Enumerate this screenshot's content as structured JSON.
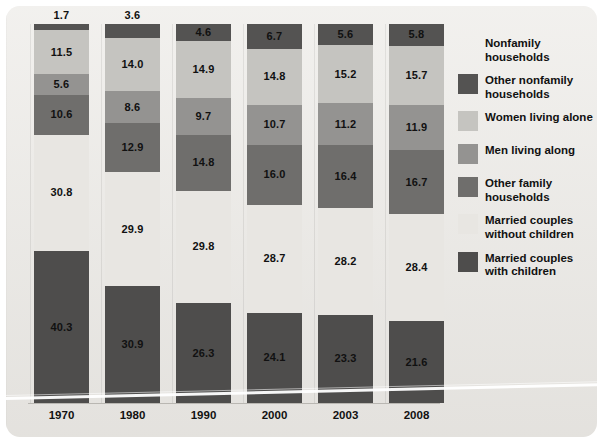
{
  "chart_data": {
    "type": "bar",
    "title": "",
    "subtitle": "",
    "xlabel": "",
    "ylabel": "",
    "stacked": true,
    "stack_mode": "percent",
    "ylim": [
      0,
      100
    ],
    "grid": false,
    "legend_position": "right",
    "categories": [
      "1970",
      "1980",
      "1990",
      "2000",
      "2003",
      "2008"
    ],
    "series": [
      {
        "name": "Other nonfamily households",
        "color": "#545352",
        "values": [
          1.7,
          3.6,
          4.6,
          6.7,
          5.6,
          5.8
        ],
        "labels": [
          "1.7",
          "3.6",
          "4.6",
          "6.7",
          "5.6",
          "5.8"
        ]
      },
      {
        "name": "Women living alone",
        "color": "#c5c4c0",
        "values": [
          11.5,
          14.0,
          14.9,
          14.8,
          15.2,
          15.7
        ],
        "labels": [
          "11.5",
          "14.0",
          "14.9",
          "14.8",
          "15.2",
          "15.7"
        ]
      },
      {
        "name": "Men living along",
        "color": "#949391",
        "values": [
          5.6,
          8.6,
          9.7,
          10.7,
          11.2,
          11.9
        ],
        "labels": [
          "5.6",
          "8.6",
          "9.7",
          "10.7",
          "11.2",
          "11.9"
        ]
      },
      {
        "name": "Other family households",
        "color": "#6f6e6c",
        "values": [
          10.6,
          12.9,
          14.8,
          16.0,
          16.4,
          16.7
        ],
        "labels": [
          "10.6",
          "12.9",
          "14.8",
          "16.0",
          "16.4",
          "16.7"
        ]
      },
      {
        "name": "Married couples without children",
        "color": "#e8e6e2",
        "values": [
          30.8,
          29.9,
          29.8,
          28.7,
          28.2,
          28.4
        ],
        "labels": [
          "30.8",
          "29.9",
          "29.8",
          "28.7",
          "28.2",
          "28.4"
        ]
      },
      {
        "name": "Married couples with children",
        "color": "#4e4d4c",
        "values": [
          40.3,
          30.9,
          26.3,
          24.1,
          23.3,
          21.6
        ],
        "labels": [
          "40.3",
          "30.9",
          "26.3",
          "24.1",
          "23.3",
          "21.6"
        ]
      }
    ]
  },
  "legend": {
    "group_header": "Nonfamily households",
    "items": [
      {
        "label": "Nonfamily households",
        "color": null,
        "has_swatch": false
      },
      {
        "label": "Other nonfamily households",
        "color": "#545352",
        "has_swatch": true
      },
      {
        "label": "Women living alone",
        "color": "#c5c4c0",
        "has_swatch": true
      },
      {
        "label": "Men living along",
        "color": "#949391",
        "has_swatch": true
      },
      {
        "label": "Other family households",
        "color": "#6f6e6c",
        "has_swatch": true
      },
      {
        "label": "Married couples without children",
        "color": "#e8e6e2",
        "has_swatch": true
      },
      {
        "label": "Married couples with children",
        "color": "#4e4d4c",
        "has_swatch": true
      }
    ]
  },
  "panel": {
    "background": "#ebe9e5"
  }
}
